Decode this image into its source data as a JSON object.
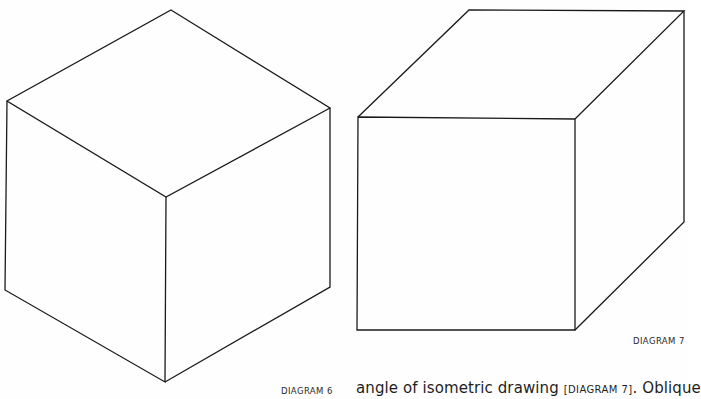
{
  "figures": [
    {
      "id": "diagram-6",
      "type": "isometric-cube",
      "caption": "DIAGRAM 6",
      "vertices": {
        "top": [
          171,
          10
        ],
        "upper_left": [
          7,
          101
        ],
        "upper_right": [
          330,
          108
        ],
        "center": [
          166,
          197
        ],
        "lower_left": [
          5,
          290
        ],
        "bottom": [
          165,
          382
        ],
        "lower_right": [
          330,
          287
        ]
      }
    },
    {
      "id": "diagram-7",
      "type": "oblique-cube",
      "caption": "DIAGRAM 7",
      "vertices": {
        "front_top_left": [
          358,
          117
        ],
        "front_top_right": [
          575,
          119
        ],
        "front_bottom_left": [
          357,
          330
        ],
        "front_bottom_right": [
          575,
          330
        ],
        "back_top_left": [
          469,
          10
        ],
        "back_top_right": [
          684,
          11
        ],
        "back_bottom_right": [
          684,
          222
        ]
      }
    }
  ],
  "text": {
    "caption_6": "DIAGRAM 6",
    "caption_7": "DIAGRAM 7",
    "body_line_pre": "angle of isometric drawing ",
    "body_line_ref": "[DIAGRAM 7]",
    "body_line_post": ". Oblique"
  },
  "colors": {
    "line": "#1a1a1a",
    "background": "#fefefe"
  }
}
